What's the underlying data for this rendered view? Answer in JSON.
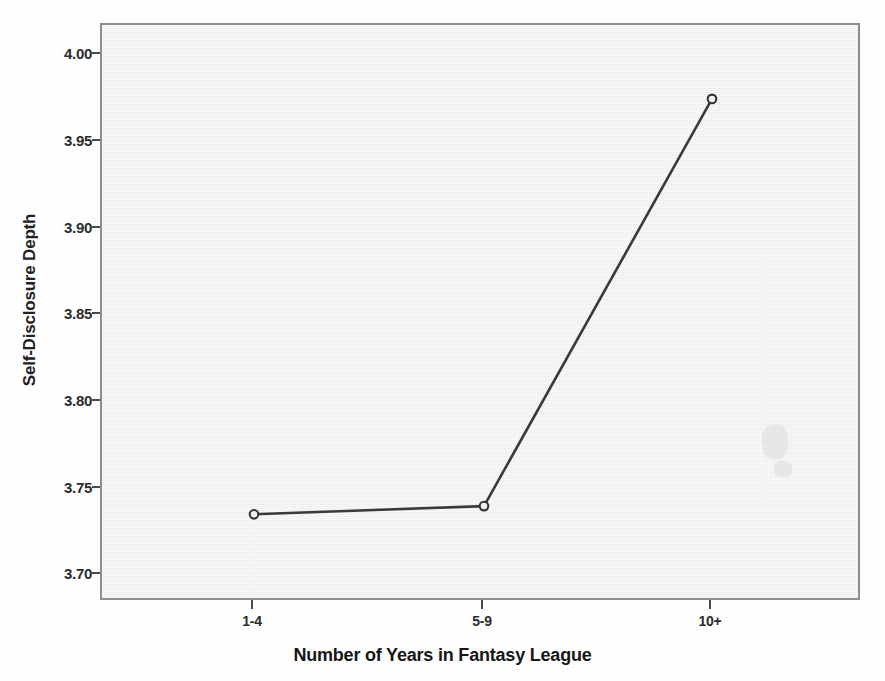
{
  "chart_data": {
    "type": "line",
    "title": "",
    "xlabel": "Number of Years in Fantasy League",
    "ylabel": "Self-Disclosure Depth",
    "categories": [
      "1-4",
      "5-9",
      "10+"
    ],
    "values": [
      3.723,
      3.728,
      3.976
    ],
    "series": [
      {
        "name": "Self-Disclosure Depth",
        "values": [
          3.723,
          3.728,
          3.976
        ]
      }
    ],
    "ylim": [
      3.672,
      4.021
    ],
    "yticks": [
      3.7,
      3.75,
      3.8,
      3.85,
      3.9,
      3.95,
      4.0
    ],
    "ytick_labels": [
      "3.70",
      "3.75",
      "3.80",
      "3.85",
      "3.90",
      "3.95",
      "4.00"
    ],
    "xtick_labels": [
      "1-4",
      "5-9",
      "10+"
    ],
    "grid": false,
    "legend": "none",
    "marker": "open-circle",
    "line_color": "#3a3a3a",
    "marker_color": "#3a3a3a",
    "panel_background": "#f0f0f0",
    "panel_border_color": "#8d8d8d",
    "page_background": "#ffffff",
    "text_color": "#222222"
  }
}
